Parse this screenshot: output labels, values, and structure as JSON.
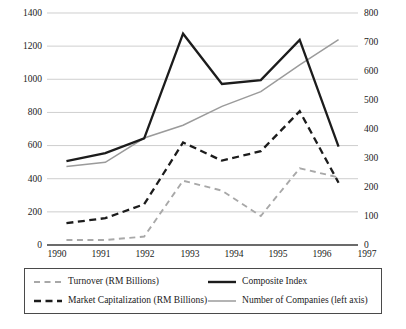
{
  "chart_data": {
    "type": "line",
    "title": "",
    "subtitle": "",
    "xlabel": "",
    "ylabel": "",
    "categories": [
      "1990",
      "1991",
      "1992",
      "1993",
      "1994",
      "1995",
      "1996",
      "1997"
    ],
    "x": [
      1990,
      1991,
      1992,
      1993,
      1994,
      1995,
      1996,
      1997
    ],
    "ylim": [
      0,
      1400
    ],
    "y2lim": [
      0,
      800
    ],
    "y_ticks": [
      0,
      200,
      400,
      600,
      800,
      1000,
      1200,
      1400
    ],
    "y2_ticks": [
      0,
      100,
      200,
      300,
      400,
      500,
      600,
      700,
      800
    ],
    "grid": true,
    "legend_position": "bottom",
    "series": [
      {
        "name": "Turnover (RM Billions)",
        "axis": "left",
        "style": "dashed",
        "color": "#a8a8a8",
        "values": [
          30,
          30,
          51,
          388,
          328,
          175,
          463,
          408
        ]
      },
      {
        "name": "Market Capitalization (RM Billions)",
        "axis": "left",
        "style": "dashed-bold",
        "color": "#1c1c1c",
        "values": [
          132,
          162,
          246,
          619,
          509,
          566,
          807,
          376
        ]
      },
      {
        "name": "Composite Index",
        "axis": "left",
        "style": "solid-bold",
        "color": "#1c1c1c",
        "values": [
          506,
          555,
          643,
          1275,
          972,
          995,
          1238,
          594
        ]
      },
      {
        "name": "Number of Companies (left axis)",
        "axis": "right",
        "style": "solid-thin",
        "color": "#9b9b9b",
        "values": [
          271,
          285,
          369,
          413,
          478,
          529,
          621,
          708
        ]
      }
    ]
  },
  "axes": {
    "left_ticks": [
      "1400",
      "1200",
      "1000",
      "800",
      "600",
      "400",
      "200",
      "0"
    ],
    "right_ticks": [
      "800",
      "700",
      "600",
      "500",
      "400",
      "300",
      "200",
      "100",
      "0"
    ],
    "x_ticks": [
      "1990",
      "1991",
      "1992",
      "1993",
      "1994",
      "1995",
      "1996",
      "1997"
    ]
  },
  "legend": {
    "entries": [
      {
        "label": "Turnover (RM Billions)",
        "marker": "dashed-gray-line"
      },
      {
        "label": "Composite Index",
        "marker": "solid-black-thick-line"
      },
      {
        "label": "Market Capitalization (RM Billions)",
        "marker": "dashed-black-thick-line"
      },
      {
        "label": "Number of Companies (left axis)",
        "marker": "solid-gray-thin-line"
      }
    ]
  }
}
